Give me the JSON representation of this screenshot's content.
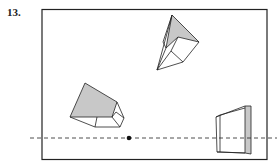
{
  "problem": {
    "number": "13."
  },
  "figure": {
    "horizon_line": "dashed",
    "vanishing_point": "dot",
    "shapes": [
      "top-skewed-box",
      "left-box",
      "right-wall-panel"
    ],
    "colors": {
      "stroke": "#222222",
      "fill_shaded": "#c8c8c8",
      "frame": "#222222"
    }
  }
}
